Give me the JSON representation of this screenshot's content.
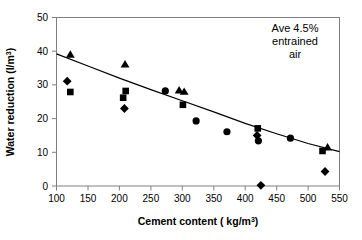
{
  "chart_data": {
    "type": "scatter",
    "title": "",
    "xlabel": "Cement content ( kg/m3)",
    "xlabel_main": "Cement content ( kg/m",
    "xlabel_sup": "3",
    "xlabel_tail": ")",
    "ylabel": "Water reduction (l/m3)",
    "ylabel_main": "Water reduction (l/m",
    "ylabel_sup": "3",
    "ylabel_tail": ")",
    "xlim": [
      100,
      550
    ],
    "ylim": [
      0,
      50
    ],
    "xticks": [
      100,
      150,
      200,
      250,
      300,
      350,
      400,
      450,
      500,
      550
    ],
    "yticks": [
      0,
      10,
      20,
      30,
      40,
      50
    ],
    "grid": false,
    "legend": "none",
    "annotations": [
      {
        "name": "ave-entrained-air-note",
        "lines": [
          "Ave 4.5%",
          "entrained",
          "air"
        ],
        "x": 470,
        "y": 45
      }
    ],
    "series": [
      {
        "name": "Diamond",
        "marker": "diamond",
        "color": "#000000",
        "points": [
          {
            "x": 117,
            "y": 31.1
          },
          {
            "x": 208,
            "y": 23.0
          },
          {
            "x": 419,
            "y": 15.0
          },
          {
            "x": 425,
            "y": 0.2
          },
          {
            "x": 527,
            "y": 4.3
          }
        ]
      },
      {
        "name": "Square",
        "marker": "square",
        "color": "#000000",
        "points": [
          {
            "x": 122,
            "y": 27.9
          },
          {
            "x": 206,
            "y": 26.2
          },
          {
            "x": 210,
            "y": 28.2
          },
          {
            "x": 301,
            "y": 24.1
          },
          {
            "x": 420,
            "y": 17.1
          },
          {
            "x": 523,
            "y": 10.4
          }
        ]
      },
      {
        "name": "Triangle",
        "marker": "triangle",
        "color": "#000000",
        "points": [
          {
            "x": 122,
            "y": 38.9
          },
          {
            "x": 209,
            "y": 36.0
          },
          {
            "x": 295,
            "y": 28.3
          },
          {
            "x": 303,
            "y": 27.9
          },
          {
            "x": 531,
            "y": 11.4
          }
        ]
      },
      {
        "name": "Circle",
        "marker": "circle",
        "color": "#000000",
        "points": [
          {
            "x": 273,
            "y": 28.2
          },
          {
            "x": 322,
            "y": 19.3
          },
          {
            "x": 371,
            "y": 16.1
          },
          {
            "x": 421,
            "y": 13.4
          },
          {
            "x": 472,
            "y": 14.2
          }
        ]
      },
      {
        "name": "Fitted trend",
        "marker": "line",
        "color": "#000000",
        "points": [
          {
            "x": 100,
            "y": 39.2
          },
          {
            "x": 150,
            "y": 35.6
          },
          {
            "x": 200,
            "y": 32.0
          },
          {
            "x": 250,
            "y": 28.6
          },
          {
            "x": 300,
            "y": 25.3
          },
          {
            "x": 350,
            "y": 22.0
          },
          {
            "x": 400,
            "y": 18.6
          },
          {
            "x": 450,
            "y": 15.5
          },
          {
            "x": 500,
            "y": 12.6
          },
          {
            "x": 550,
            "y": 10.2
          }
        ]
      }
    ]
  }
}
